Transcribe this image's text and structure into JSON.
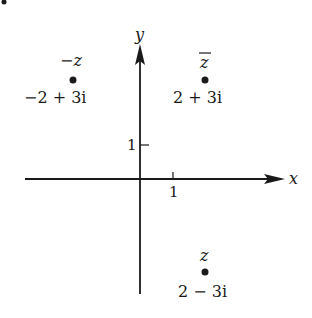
{
  "figure": {
    "axes": {
      "x_label": "x",
      "y_label": "y",
      "x_tick_label": "1",
      "y_tick_label": "1"
    },
    "points": [
      {
        "name": "-z",
        "symbol": "−z",
        "value": "−2 + 3i",
        "re": -2,
        "im": 3
      },
      {
        "name": "conj-z",
        "symbol": "z",
        "value": "2 + 3i",
        "re": 2,
        "im": 3
      },
      {
        "name": "z",
        "symbol": "z",
        "value": "2 − 3i",
        "re": 2,
        "im": -3
      }
    ],
    "colors": {
      "ink": "#1a1a1a",
      "background": "#ffffff"
    }
  }
}
